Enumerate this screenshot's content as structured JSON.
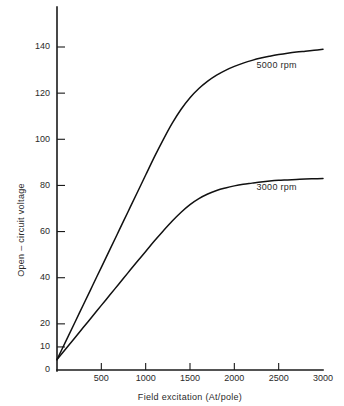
{
  "chart_data": {
    "type": "line",
    "title": "",
    "xlabel": "Field excitation (At/pole)",
    "ylabel": "Open – circuit voltage",
    "xlim": [
      0,
      3000
    ],
    "ylim": [
      0,
      150
    ],
    "grid": false,
    "legend_position": "inline-right-of-curve",
    "xticks": [
      500,
      1000,
      1500,
      2000,
      2500,
      3000
    ],
    "xtick_labels": [
      "500",
      "1000",
      "1500",
      "2000",
      "2500",
      "3000"
    ],
    "yticks": [
      0,
      10,
      20,
      40,
      60,
      80,
      100,
      120,
      140
    ],
    "ytick_labels": [
      "0",
      "10",
      "20",
      "40",
      "60",
      "80",
      "100",
      "120",
      "140"
    ],
    "series": [
      {
        "name": "5000 rpm",
        "label": "5000 rpm",
        "label_x": 2250,
        "label_y": 131,
        "color": "#111111",
        "x": [
          0,
          100,
          200,
          300,
          400,
          500,
          600,
          700,
          800,
          900,
          1000,
          1100,
          1200,
          1300,
          1400,
          1500,
          1600,
          1700,
          1800,
          1900,
          2000,
          2100,
          2200,
          2300,
          2400,
          2500,
          2600,
          2700,
          2800,
          2900,
          3000
        ],
        "y": [
          4.5,
          12.5,
          20.5,
          28.5,
          36.5,
          44.5,
          52.5,
          60.5,
          68.5,
          76.5,
          84.5,
          92.5,
          100.0,
          107.0,
          113.0,
          118.0,
          122.0,
          125.2,
          127.8,
          129.9,
          131.6,
          133.0,
          134.2,
          135.2,
          136.0,
          136.7,
          137.3,
          137.8,
          138.2,
          138.6,
          139.0
        ]
      },
      {
        "name": "3000 rpm",
        "label": "3000 rpm",
        "label_x": 2250,
        "label_y": 78,
        "color": "#111111",
        "x": [
          0,
          100,
          200,
          300,
          400,
          500,
          600,
          700,
          800,
          900,
          1000,
          1100,
          1200,
          1300,
          1400,
          1500,
          1600,
          1700,
          1800,
          1900,
          2000,
          2100,
          2200,
          2300,
          2400,
          2500,
          2600,
          2700,
          2800,
          2900,
          3000
        ],
        "y": [
          4.5,
          9.2,
          13.9,
          18.6,
          23.3,
          28.0,
          32.7,
          37.4,
          42.1,
          46.8,
          51.4,
          56.0,
          60.4,
          64.6,
          68.4,
          71.7,
          74.3,
          76.3,
          77.8,
          78.9,
          79.8,
          80.5,
          81.0,
          81.5,
          81.9,
          82.2,
          82.4,
          82.6,
          82.8,
          82.9,
          83.0
        ]
      }
    ]
  },
  "colors": {
    "axis": "#1a1a1a",
    "text": "#2a2a2a",
    "curve": "#111111",
    "background": "#ffffff"
  }
}
